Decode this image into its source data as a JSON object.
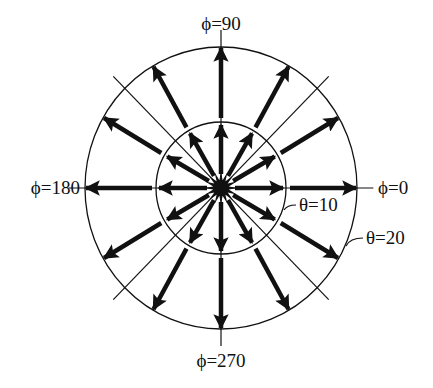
{
  "diagram": {
    "labels": {
      "phi_90": "ϕ=90",
      "phi_180": "ϕ=180",
      "phi_0": "ϕ=0",
      "phi_270": "ϕ=270",
      "theta_10": "θ=10",
      "theta_20": "θ=20"
    },
    "rings": [
      {
        "name": "theta-10",
        "theta": 10
      },
      {
        "name": "theta-20",
        "theta": 20
      }
    ],
    "arrow_directions_deg": [
      0,
      30,
      60,
      90,
      120,
      150,
      180,
      210,
      240,
      270,
      300,
      330
    ],
    "guide_line_directions_deg": [
      0,
      45,
      90,
      135
    ],
    "colors": {
      "ink": "#111111",
      "background": "#ffffff"
    }
  }
}
